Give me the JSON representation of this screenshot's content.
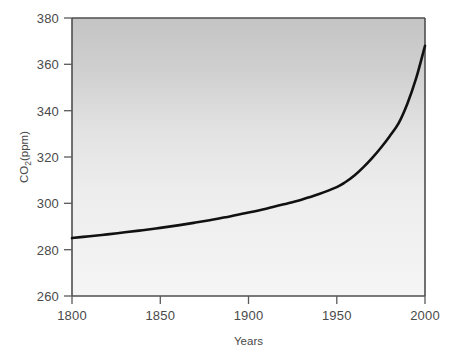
{
  "chart_data": {
    "type": "line",
    "title": "",
    "subtitle": "",
    "xlabel": "Years",
    "ylabel": "CO2(ppm)",
    "ylabel_display": "CO",
    "ylabel_sub": "2",
    "ylabel_tail": "(ppm)",
    "xlim": [
      1800,
      2000
    ],
    "ylim": [
      260,
      380
    ],
    "xticks": [
      1800,
      1850,
      1900,
      1950,
      2000
    ],
    "xtick_labels": [
      "1800",
      "1850",
      "1900",
      "1950",
      "2000"
    ],
    "yticks": [
      260,
      280,
      300,
      320,
      340,
      360,
      380
    ],
    "ytick_labels": [
      "260",
      "280",
      "300",
      "320",
      "340",
      "360",
      "380"
    ],
    "grid": false,
    "legend": null,
    "legend_position": "none",
    "annotations": [],
    "series": [
      {
        "name": "Atmospheric CO2 concentration",
        "color": "#111111",
        "line_width": 2.6,
        "x": [
          1800,
          1810,
          1820,
          1830,
          1840,
          1850,
          1860,
          1870,
          1880,
          1890,
          1900,
          1910,
          1920,
          1930,
          1940,
          1950,
          1955,
          1960,
          1965,
          1970,
          1975,
          1980,
          1985,
          1990,
          1995,
          2000
        ],
        "values": [
          285.0,
          285.8,
          286.6,
          287.5,
          288.4,
          289.4,
          290.5,
          291.7,
          293.0,
          294.4,
          296.0,
          297.7,
          299.6,
          301.6,
          304.0,
          307.0,
          309.2,
          312.0,
          315.5,
          319.5,
          324.0,
          329.0,
          334.5,
          343.0,
          354.0,
          368.0
        ]
      }
    ],
    "plot_background": {
      "gradient_top": "#c6c6c6",
      "gradient_mid": "#e6e6e6",
      "gradient_bottom": "#f4f4f4"
    },
    "axis_color": "#555555",
    "figure_background": "#ffffff"
  }
}
